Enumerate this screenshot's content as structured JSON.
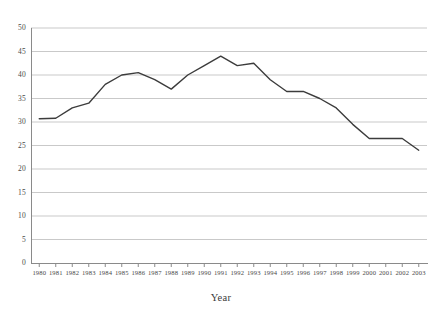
{
  "chart_data": {
    "type": "line",
    "title": "",
    "subtitle": "",
    "xlabel": "Year",
    "ylabel": "",
    "categories": [
      "1980",
      "1981",
      "1982",
      "1983",
      "1984",
      "1985",
      "1986",
      "1987",
      "1988",
      "1989",
      "1990",
      "1991",
      "1992",
      "1993",
      "1994",
      "1995",
      "1996",
      "1997",
      "1998",
      "1999",
      "2000",
      "2001",
      "2002",
      "2003"
    ],
    "values": [
      30.7,
      30.8,
      33.0,
      34.0,
      38.0,
      40.0,
      40.5,
      39.0,
      37.0,
      40.0,
      42.0,
      44.0,
      42.0,
      42.5,
      39.0,
      36.5,
      36.5,
      35.0,
      33.0,
      29.5,
      26.5,
      26.5,
      26.5,
      24.0
    ],
    "ylim": [
      0,
      50
    ],
    "y_ticks": [
      0,
      5,
      10,
      15,
      20,
      25,
      30,
      35,
      40,
      45,
      50
    ],
    "y_tick_labels": [
      "0",
      "5",
      "10",
      "15",
      "20",
      "25",
      "30",
      "35",
      "40",
      "45",
      "50"
    ],
    "grid": "horizontal",
    "legend": "none",
    "series": [
      {
        "name": "series-1",
        "color": "#3c3c3c",
        "values": [
          30.7,
          30.8,
          33.0,
          34.0,
          38.0,
          40.0,
          40.5,
          39.0,
          37.0,
          40.0,
          42.0,
          44.0,
          42.0,
          42.5,
          39.0,
          36.5,
          36.5,
          35.0,
          33.0,
          29.5,
          26.5,
          26.5,
          26.5,
          24.0
        ]
      }
    ]
  },
  "style": {
    "line_color": "#3c3c3c",
    "grid_color": "#c9c9c9",
    "axis_color": "#8a8a8a",
    "background": "#ffffff",
    "text_color": "#4a4a4a"
  }
}
